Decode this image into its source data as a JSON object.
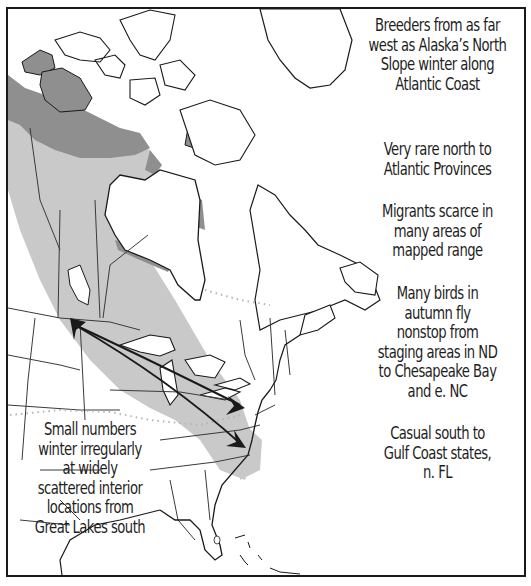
{
  "map": {
    "title": "Range map",
    "colors": {
      "breeding_range": "#8f8f8f",
      "migration_range": "#c9c9c9",
      "winter_range_marker": "#a8a8a8",
      "coastline": "#1a1a1a",
      "border": "#3a3a3a",
      "dotted_line": "#b4b4b4",
      "background": "#ffffff"
    },
    "legend_icons": [
      "breeding-range-dark-shading",
      "migration-range-light-shading",
      "migration-route-arrow",
      "dotted-range-limit-line"
    ]
  },
  "notes": {
    "breeders": "Breeders from as far\nwest as Alaska’s North\nSlope winter along\nAtlantic Coast",
    "very_rare": "Very rare north to\nAtlantic Provinces",
    "migrants_scarce": "Migrants scarce in\nmany areas of\nmapped range",
    "nonstop": "Many birds in\nautumn fly\nnonstop from\nstaging areas in ND\nto Chesapeake Bay\nand e. NC",
    "casual_south": "Casual south to\nGulf Coast states,\nn. FL",
    "small_numbers": "Small numbers\nwinter irregularly\nat widely\nscattered interior\nlocations from\nGreat Lakes south"
  }
}
